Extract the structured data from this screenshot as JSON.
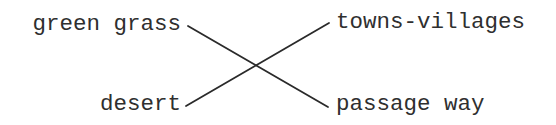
{
  "diagram": {
    "type": "matching-crossed-lines",
    "left_items": [
      {
        "label": "green grass"
      },
      {
        "label": "desert"
      }
    ],
    "right_items": [
      {
        "label": "towns-villages"
      },
      {
        "label": "passage way"
      }
    ],
    "connections": [
      {
        "from": "green grass",
        "to": "passage way",
        "x1": 188,
        "y1": 26,
        "x2": 328,
        "y2": 107
      },
      {
        "from": "desert",
        "to": "towns-villages",
        "x1": 186,
        "y1": 106,
        "x2": 329,
        "y2": 23
      }
    ],
    "colors": {
      "text": "#2f2f2f",
      "line": "#2a2a2a",
      "background": "#ffffff"
    }
  }
}
